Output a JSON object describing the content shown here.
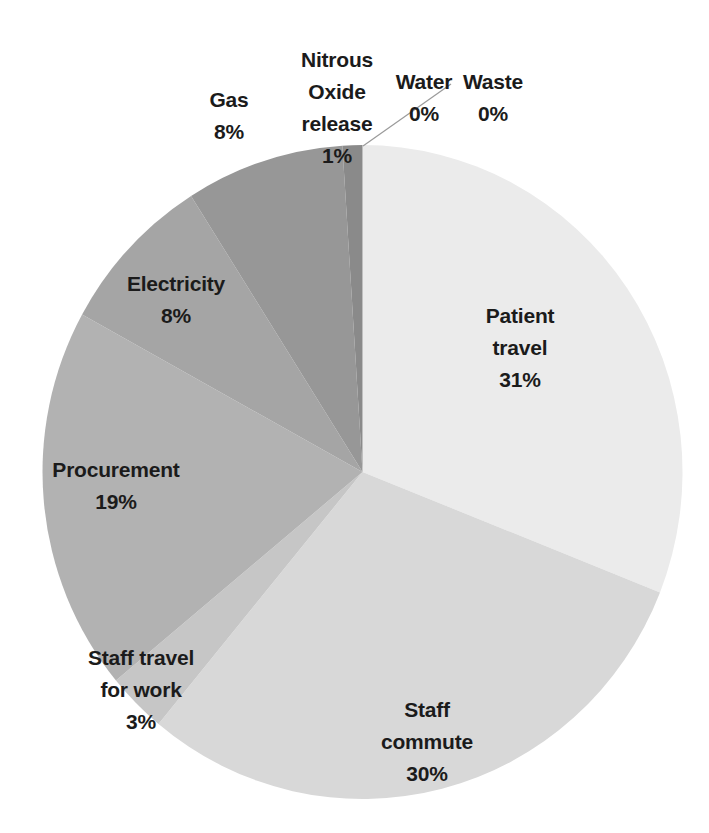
{
  "figure": {
    "background_color": "#ffffff",
    "label_text_color": "#1b1b1b",
    "leader_line_color": "#9a9a9a"
  },
  "chart_data": {
    "type": "pie",
    "title": "",
    "legend": "none",
    "direction": "clockwise",
    "start_angle_deg": 0,
    "units": "%",
    "categories": [
      "Patient travel",
      "Staff commute",
      "Staff travel for work",
      "Procurement",
      "Electricity",
      "Gas",
      "Nitrous Oxide release",
      "Water",
      "Waste"
    ],
    "values": [
      31,
      30,
      3,
      19,
      8,
      8,
      1,
      0,
      0
    ],
    "percent_labels": [
      "31%",
      "30%",
      "3%",
      "19%",
      "8%",
      "8%",
      "1%",
      "0%",
      "0%"
    ],
    "colors": [
      "#ebebeb",
      "#d8d8d8",
      "#c6c6c6",
      "#b2b2b2",
      "#a5a5a5",
      "#979797",
      "#8a8a8a",
      "#e0e0e0",
      "#e0e0e0"
    ]
  }
}
